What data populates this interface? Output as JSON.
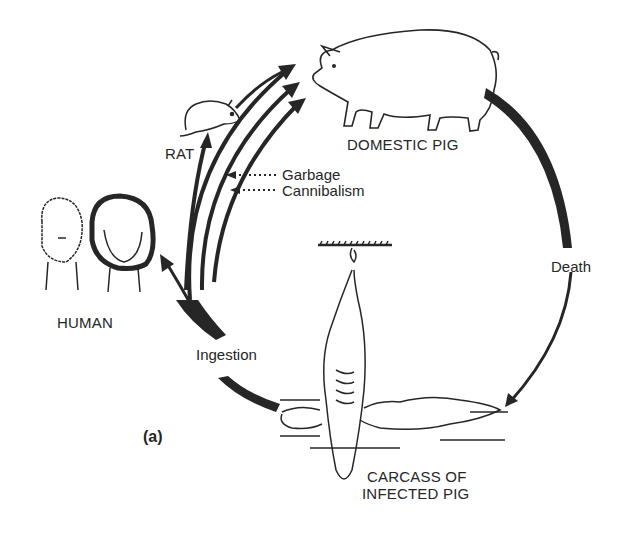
{
  "diagram": {
    "panel_label": "(a)",
    "nodes": {
      "domestic_pig": "DOMESTIC PIG",
      "rat": "RAT",
      "human": "HUMAN",
      "carcass_line1": "CARCASS OF",
      "carcass_line2": "INFECTED PIG"
    },
    "edges": {
      "garbage": "Garbage",
      "cannibalism": "Cannibalism",
      "death": "Death",
      "ingestion": "Ingestion"
    },
    "colors": {
      "ink": "#222222",
      "background": "#ffffff"
    }
  }
}
